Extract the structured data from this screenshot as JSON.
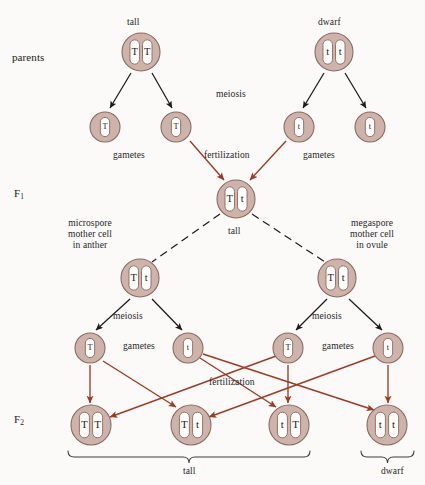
{
  "diagram": {
    "colors": {
      "cell_fill": "#cdb3aa",
      "cell_stroke": "#8a6a60",
      "chromosome_fill": "#fdfcfb",
      "chromosome_stroke": "#8a6a60",
      "meiosis_arrow": "#1c1c1c",
      "fertilization_arrow": "#9c3b24",
      "bracket": "#3a3a3a",
      "text": "#262626",
      "background": "#fbfaf8"
    },
    "stage_labels": [
      {
        "id": "parents",
        "text": "parents",
        "x": 12,
        "y": 52
      },
      {
        "id": "f1",
        "text": "F",
        "sub": "1",
        "x": 14,
        "y": 188
      },
      {
        "id": "f2",
        "text": "F",
        "sub": "2",
        "x": 14,
        "y": 414
      }
    ],
    "annotations": [
      {
        "id": "tall-parent-label",
        "text": "tall",
        "x": 127,
        "y": 17
      },
      {
        "id": "dwarf-parent-label",
        "text": "dwarf",
        "x": 318,
        "y": 17
      },
      {
        "id": "meiosis-parents",
        "text": "meiosis",
        "x": 216,
        "y": 89
      },
      {
        "id": "gametes-left-p",
        "text": "gametes",
        "x": 113,
        "y": 150
      },
      {
        "id": "fertilization-p",
        "text": "fertilization",
        "x": 204,
        "y": 150
      },
      {
        "id": "gametes-right-p",
        "text": "gametes",
        "x": 303,
        "y": 150
      },
      {
        "id": "f1-tall-label",
        "text": "tall",
        "x": 228,
        "y": 226
      },
      {
        "id": "microspore-label",
        "text": "microspore\nmother cell\nin anther",
        "x": 68,
        "y": 218
      },
      {
        "id": "megaspore-label",
        "text": "megaspore\nmother cell\nin ovule",
        "x": 350,
        "y": 218
      },
      {
        "id": "meiosis-left-f1",
        "text": "meiosis",
        "x": 113,
        "y": 311
      },
      {
        "id": "meiosis-right-f1",
        "text": "meiosis",
        "x": 312,
        "y": 311
      },
      {
        "id": "gametes-left-f1",
        "text": "gametes",
        "x": 123,
        "y": 341
      },
      {
        "id": "gametes-right-f1",
        "text": "gametes",
        "x": 322,
        "y": 341
      },
      {
        "id": "fertilization-f1",
        "text": "fertilization",
        "x": 209,
        "y": 377
      },
      {
        "id": "tall-bracket-label",
        "text": "tall",
        "x": 183,
        "y": 466
      },
      {
        "id": "dwarf-bracket-label",
        "text": "dwarf",
        "x": 381,
        "y": 466
      }
    ],
    "cells": [
      {
        "id": "parent-tall",
        "role": "parent",
        "cx": 141,
        "cy": 52,
        "r": 19,
        "alleles": [
          "T",
          "T"
        ]
      },
      {
        "id": "parent-dwarf",
        "role": "parent",
        "cx": 334,
        "cy": 52,
        "r": 19,
        "alleles": [
          "t",
          "t"
        ]
      },
      {
        "id": "gamete-p-1",
        "role": "gamete",
        "cx": 105,
        "cy": 127,
        "r": 15,
        "alleles": [
          "T"
        ]
      },
      {
        "id": "gamete-p-2",
        "role": "gamete",
        "cx": 176,
        "cy": 127,
        "r": 15,
        "alleles": [
          "T"
        ]
      },
      {
        "id": "gamete-p-3",
        "role": "gamete",
        "cx": 299,
        "cy": 127,
        "r": 15,
        "alleles": [
          "t"
        ]
      },
      {
        "id": "gamete-p-4",
        "role": "gamete",
        "cx": 370,
        "cy": 127,
        "r": 15,
        "alleles": [
          "t"
        ]
      },
      {
        "id": "f1-zygote",
        "role": "f1",
        "cx": 236,
        "cy": 199,
        "r": 19,
        "alleles": [
          "T",
          "t"
        ]
      },
      {
        "id": "microspore-mother-cell",
        "role": "mother-cell",
        "cx": 140,
        "cy": 278,
        "r": 19,
        "alleles": [
          "T",
          "t"
        ]
      },
      {
        "id": "megaspore-mother-cell",
        "role": "mother-cell",
        "cx": 337,
        "cy": 278,
        "r": 19,
        "alleles": [
          "T",
          "t"
        ]
      },
      {
        "id": "gamete-f1-1",
        "role": "gamete",
        "cx": 90,
        "cy": 348,
        "r": 15,
        "alleles": [
          "T"
        ]
      },
      {
        "id": "gamete-f1-2",
        "role": "gamete",
        "cx": 188,
        "cy": 348,
        "r": 15,
        "alleles": [
          "t"
        ]
      },
      {
        "id": "gamete-f1-3",
        "role": "gamete",
        "cx": 288,
        "cy": 348,
        "r": 15,
        "alleles": [
          "T"
        ]
      },
      {
        "id": "gamete-f1-4",
        "role": "gamete",
        "cx": 388,
        "cy": 348,
        "r": 15,
        "alleles": [
          "t"
        ]
      },
      {
        "id": "f2-zygote-1",
        "role": "f2",
        "cx": 91,
        "cy": 425,
        "r": 20,
        "alleles": [
          "T",
          "T"
        ]
      },
      {
        "id": "f2-zygote-2",
        "role": "f2",
        "cx": 191,
        "cy": 425,
        "r": 20,
        "alleles": [
          "T",
          "t"
        ]
      },
      {
        "id": "f2-zygote-3",
        "role": "f2",
        "cx": 289,
        "cy": 425,
        "r": 20,
        "alleles": [
          "t",
          "T"
        ]
      },
      {
        "id": "f2-zygote-4",
        "role": "f2",
        "cx": 387,
        "cy": 425,
        "r": 20,
        "alleles": [
          "t",
          "t"
        ]
      }
    ],
    "meiosis_arrows": [
      {
        "id": "m-p-1",
        "x1": 131,
        "y1": 73,
        "x2": 110,
        "y2": 108
      },
      {
        "id": "m-p-2",
        "x1": 152,
        "y1": 73,
        "x2": 172,
        "y2": 108
      },
      {
        "id": "m-p-3",
        "x1": 324,
        "y1": 73,
        "x2": 303,
        "y2": 108
      },
      {
        "id": "m-p-4",
        "x1": 345,
        "y1": 73,
        "x2": 366,
        "y2": 108
      },
      {
        "id": "m-f1-1",
        "x1": 130,
        "y1": 299,
        "x2": 96,
        "y2": 330
      },
      {
        "id": "m-f1-2",
        "x1": 152,
        "y1": 299,
        "x2": 182,
        "y2": 330
      },
      {
        "id": "m-f1-3",
        "x1": 327,
        "y1": 299,
        "x2": 296,
        "y2": 330
      },
      {
        "id": "m-f1-4",
        "x1": 349,
        "y1": 299,
        "x2": 382,
        "y2": 330
      }
    ],
    "fertilization_arrows_p": [
      {
        "id": "f-p-1",
        "x1": 190,
        "y1": 141,
        "x2": 224,
        "y2": 180
      },
      {
        "id": "f-p-2",
        "x1": 286,
        "y1": 141,
        "x2": 250,
        "y2": 180
      }
    ],
    "dashed_lines": [
      {
        "id": "d-left",
        "x1": 220,
        "y1": 214,
        "x2": 152,
        "y2": 262
      },
      {
        "id": "d-right",
        "x1": 252,
        "y1": 214,
        "x2": 325,
        "y2": 262
      }
    ],
    "fertilization_arrows_f2": [
      {
        "id": "fz-1",
        "x1": 90,
        "y1": 365,
        "x2": 90,
        "y2": 403,
        "style": "straight"
      },
      {
        "id": "fz-2",
        "x1": 288,
        "y1": 365,
        "x2": 288,
        "y2": 403,
        "style": "straight"
      },
      {
        "id": "fz-3",
        "x1": 388,
        "y1": 365,
        "x2": 388,
        "y2": 403,
        "style": "straight"
      },
      {
        "id": "fz-4",
        "x1": 103,
        "y1": 361,
        "x2": 176,
        "y2": 407,
        "style": "cross"
      },
      {
        "id": "fz-5",
        "x1": 200,
        "y1": 358,
        "x2": 276,
        "y2": 407,
        "style": "cross"
      },
      {
        "id": "fz-6",
        "x1": 203,
        "y1": 354,
        "x2": 374,
        "y2": 410,
        "style": "cross"
      },
      {
        "id": "fz-7",
        "x1": 276,
        "y1": 356,
        "x2": 110,
        "y2": 417,
        "style": "cross"
      },
      {
        "id": "fz-8",
        "x1": 375,
        "y1": 356,
        "x2": 209,
        "y2": 417,
        "style": "cross"
      }
    ],
    "brackets": [
      {
        "id": "bracket-tall",
        "x1": 68,
        "x2": 310,
        "y": 451,
        "label": "tall"
      },
      {
        "id": "bracket-dwarf",
        "x1": 361,
        "x2": 414,
        "y": 451,
        "label": "dwarf"
      }
    ]
  },
  "chart_data": {
    "type": "diagram",
    "generations": [
      {
        "name": "parents",
        "individuals": [
          {
            "phenotype": "tall",
            "genotype": "TT"
          },
          {
            "phenotype": "dwarf",
            "genotype": "tt"
          }
        ],
        "gametes": [
          "T",
          "T",
          "t",
          "t"
        ],
        "process": "meiosis"
      },
      {
        "name": "F1",
        "individuals": [
          {
            "phenotype": "tall",
            "genotype": "Tt"
          }
        ],
        "mother_cells": [
          {
            "name": "microspore mother cell in anther",
            "genotype": "Tt"
          },
          {
            "name": "megaspore mother cell in ovule",
            "genotype": "Tt"
          }
        ],
        "gametes": [
          "T",
          "t",
          "T",
          "t"
        ],
        "process": "meiosis"
      },
      {
        "name": "F2",
        "individuals": [
          {
            "genotype": "TT",
            "phenotype": "tall"
          },
          {
            "genotype": "Tt",
            "phenotype": "tall"
          },
          {
            "genotype": "tT",
            "phenotype": "tall"
          },
          {
            "genotype": "tt",
            "phenotype": "dwarf"
          }
        ],
        "phenotype_ratio": "3 tall : 1 dwarf"
      }
    ]
  }
}
